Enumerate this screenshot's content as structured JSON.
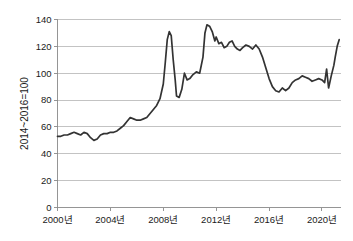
{
  "chart_data": {
    "type": "line",
    "title": "",
    "subtitle": "",
    "xlabel": "",
    "ylabel": "2014~2016=100",
    "ylim": [
      0,
      140
    ],
    "ytick_values": [
      0,
      20,
      40,
      60,
      80,
      100,
      120,
      140
    ],
    "ytick_labels": [
      "0",
      "20",
      "40",
      "60",
      "80",
      "100",
      "120",
      "140"
    ],
    "xlim": [
      2000.0,
      2021.4
    ],
    "xtick_values": [
      2000,
      2004,
      2008,
      2012,
      2016,
      2020
    ],
    "xtick_labels": [
      "2000년",
      "2004년",
      "2008년",
      "2012년",
      "2016년",
      "2020년"
    ],
    "grid": "horizontal",
    "legend_position": "none",
    "line_color": "#333333",
    "grid_color": "#aaaaaa",
    "axis_color": "#8a8a8a",
    "background_color": "#ffffff",
    "series": [
      {
        "name": "index",
        "x": [
          2000.0,
          2000.25,
          2000.5,
          2000.75,
          2001.0,
          2001.25,
          2001.5,
          2001.75,
          2002.0,
          2002.25,
          2002.5,
          2002.75,
          2003.0,
          2003.25,
          2003.5,
          2003.75,
          2004.0,
          2004.25,
          2004.5,
          2004.75,
          2005.0,
          2005.25,
          2005.5,
          2005.75,
          2006.0,
          2006.25,
          2006.5,
          2006.75,
          2007.0,
          2007.25,
          2007.5,
          2007.75,
          2008.0,
          2008.15,
          2008.3,
          2008.45,
          2008.6,
          2008.75,
          2008.9,
          2009.0,
          2009.2,
          2009.4,
          2009.6,
          2009.8,
          2010.0,
          2010.25,
          2010.5,
          2010.75,
          2011.0,
          2011.15,
          2011.3,
          2011.5,
          2011.7,
          2011.9,
          2012.0,
          2012.2,
          2012.4,
          2012.6,
          2012.8,
          2013.0,
          2013.2,
          2013.4,
          2013.6,
          2013.8,
          2014.0,
          2014.25,
          2014.5,
          2014.75,
          2015.0,
          2015.25,
          2015.5,
          2015.75,
          2016.0,
          2016.25,
          2016.5,
          2016.75,
          2017.0,
          2017.25,
          2017.5,
          2017.75,
          2018.0,
          2018.25,
          2018.5,
          2018.75,
          2019.0,
          2019.25,
          2019.5,
          2019.75,
          2020.0,
          2020.2,
          2020.35,
          2020.5,
          2020.7,
          2020.9,
          2021.0,
          2021.15,
          2021.3
        ],
        "values": [
          53,
          53,
          54,
          54,
          55,
          56,
          55,
          54,
          56,
          55,
          52,
          50,
          51,
          54,
          55,
          55,
          56,
          56,
          57,
          59,
          61,
          64,
          67,
          66,
          65,
          65,
          66,
          67,
          70,
          73,
          76,
          81,
          92,
          108,
          125,
          131,
          128,
          110,
          95,
          83,
          82,
          88,
          100,
          95,
          96,
          99,
          101,
          100,
          112,
          130,
          136,
          135,
          131,
          124,
          127,
          122,
          123,
          119,
          120,
          123,
          124,
          120,
          118,
          117,
          119,
          121,
          120,
          118,
          121,
          118,
          112,
          104,
          96,
          90,
          87,
          86,
          89,
          87,
          89,
          93,
          95,
          96,
          98,
          97,
          96,
          94,
          95,
          96,
          95,
          93,
          103,
          89,
          98,
          106,
          112,
          120,
          125
        ]
      }
    ],
    "annotations": []
  }
}
